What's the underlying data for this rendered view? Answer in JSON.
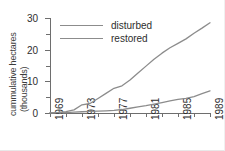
{
  "chart_data": {
    "type": "line",
    "title": "",
    "xlabel": "",
    "ylabel": "cummulative hectares (thousands)",
    "ylabel_line1": "cummulative hectares",
    "ylabel_line2": "(thousands)",
    "xlim": [
      1969,
      1989
    ],
    "ylim": [
      0,
      30
    ],
    "grid": false,
    "legend_position": "top-left",
    "y_ticks_major": [
      0,
      10,
      20,
      30
    ],
    "y_ticks_minor": [
      5,
      15,
      25
    ],
    "x_ticks": [
      1969,
      1971,
      1973,
      1975,
      1977,
      1979,
      1981,
      1983,
      1985,
      1987,
      1989
    ],
    "x_tick_labels": [
      "1969",
      "",
      "1973",
      "",
      "1977",
      "",
      "1981",
      "",
      "1985",
      "",
      "1989"
    ],
    "x_labeled": [
      "1969",
      "1973",
      "1977",
      "1981",
      "1985",
      "1989"
    ],
    "x": [
      1969,
      1970,
      1971,
      1972,
      1973,
      1974,
      1975,
      1976,
      1977,
      1978,
      1979,
      1980,
      1981,
      1982,
      1983,
      1984,
      1985,
      1986,
      1987,
      1988,
      1989
    ],
    "series": [
      {
        "name": "disturbed",
        "color": "#8c8c8c",
        "values": [
          0.1,
          0.2,
          0.4,
          1.0,
          2.6,
          3.0,
          4.6,
          6.2,
          7.8,
          8.6,
          10.4,
          12.6,
          14.8,
          17.0,
          18.9,
          20.6,
          22.0,
          23.4,
          25.2,
          26.8,
          28.5
        ]
      },
      {
        "name": "restored",
        "color": "#8c8c8c",
        "values": [
          0.05,
          0.1,
          0.15,
          0.25,
          0.4,
          0.5,
          0.6,
          0.7,
          0.85,
          1.1,
          1.5,
          1.9,
          2.3,
          2.8,
          3.3,
          3.8,
          4.3,
          4.6,
          5.2,
          6.1,
          7.0
        ]
      }
    ]
  },
  "legend": {
    "items": [
      {
        "label": "disturbed"
      },
      {
        "label": "restored"
      }
    ]
  }
}
